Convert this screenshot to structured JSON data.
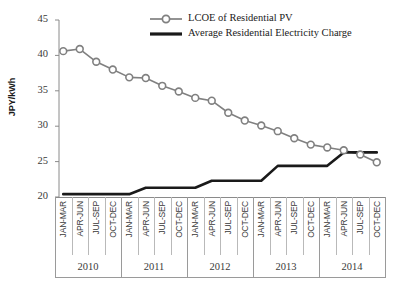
{
  "chart": {
    "ylabel": "JPY/kWh",
    "y_ticks": [
      "45",
      "40",
      "35",
      "30",
      "25",
      "20"
    ],
    "legend": {
      "series1": "LCOE of Residential PV",
      "series2": "Average Residential Electricity Charge"
    },
    "years": [
      "2010",
      "2011",
      "2012",
      "2013",
      "2014"
    ],
    "quarter_labels": [
      "JAN-MAR",
      "APR-JUN",
      "JUL-SEP",
      "OCT-DEC"
    ],
    "colors": {
      "series1": "#808080",
      "series2": "#1a1a1a",
      "axis": "#8a8a8a",
      "text": "#3a3a3a"
    }
  },
  "chart_data": {
    "type": "line",
    "title": "",
    "xlabel": "",
    "ylabel": "JPY/kWh",
    "ylim": [
      20,
      45
    ],
    "grid": false,
    "legend_position": "top-right",
    "categories": [
      "2010 JAN-MAR",
      "2010 APR-JUN",
      "2010 JUL-SEP",
      "2010 OCT-DEC",
      "2011 JAN-MAR",
      "2011 APR-JUN",
      "2011 JUL-SEP",
      "2011 OCT-DEC",
      "2012 JAN-MAR",
      "2012 APR-JUN",
      "2012 JUL-SEP",
      "2012 OCT-DEC",
      "2013 JAN-MAR",
      "2013 APR-JUN",
      "2013 JUL-SEP",
      "2013 OCT-DEC",
      "2014 JAN-MAR",
      "2014 APR-JUN",
      "2014 JUL-SEP",
      "2014 OCT-DEC"
    ],
    "series": [
      {
        "name": "LCOE of Residential PV",
        "marker": "circle",
        "color": "#808080",
        "values": [
          40.6,
          40.9,
          39.1,
          38.0,
          36.9,
          36.8,
          35.7,
          34.9,
          34.0,
          33.6,
          31.9,
          30.8,
          30.1,
          29.3,
          28.3,
          27.4,
          27.0,
          26.6,
          26.0,
          24.9
        ]
      },
      {
        "name": "Average Residential Electricity Charge",
        "marker": "none",
        "color": "#1a1a1a",
        "values": [
          20.4,
          20.4,
          20.4,
          20.4,
          20.4,
          21.3,
          21.3,
          21.3,
          21.3,
          22.3,
          22.3,
          22.3,
          22.3,
          24.4,
          24.4,
          24.4,
          24.4,
          26.3,
          26.3,
          26.3
        ]
      }
    ]
  }
}
